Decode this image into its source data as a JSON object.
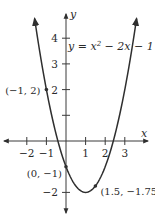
{
  "chart_data": {
    "type": "line",
    "title": "",
    "equation_label": "y = x² − 2x − 1",
    "equation": {
      "prefix": "y = x",
      "exponent": "2",
      "suffix": " − 2x − 1"
    },
    "xlabel": "x",
    "ylabel": "y",
    "xlim": [
      -2.5,
      3.8
    ],
    "ylim": [
      -2.5,
      4.6
    ],
    "x_ticks": [
      -2,
      -1,
      1,
      2,
      3
    ],
    "x_tick_labels": [
      "−2",
      "−1",
      "1",
      "2",
      "3"
    ],
    "y_ticks": [
      -2,
      1,
      2,
      3,
      4
    ],
    "y_tick_labels": [
      "−2",
      "",
      "2",
      "3",
      "4"
    ],
    "grid": false,
    "series": [
      {
        "name": "y = x^2 - 2x - 1",
        "function": "x^2 - 2x - 1",
        "x_range": [
          -1.6,
          3.6
        ],
        "arrows_at_ends": true
      }
    ],
    "points": [
      {
        "x": -1,
        "y": 2,
        "label": "(−1, 2)"
      },
      {
        "x": 0,
        "y": -1,
        "label": "(0, −1)"
      },
      {
        "x": 1.5,
        "y": -1.75,
        "label": "(1.5, −1.75)"
      }
    ],
    "vertex": {
      "x": 1,
      "y": -2
    }
  },
  "colors": {
    "axis": "#3a3a3a",
    "curve": "#2f2f2f",
    "text": "#2a2a2a",
    "background": "#ffffff"
  }
}
